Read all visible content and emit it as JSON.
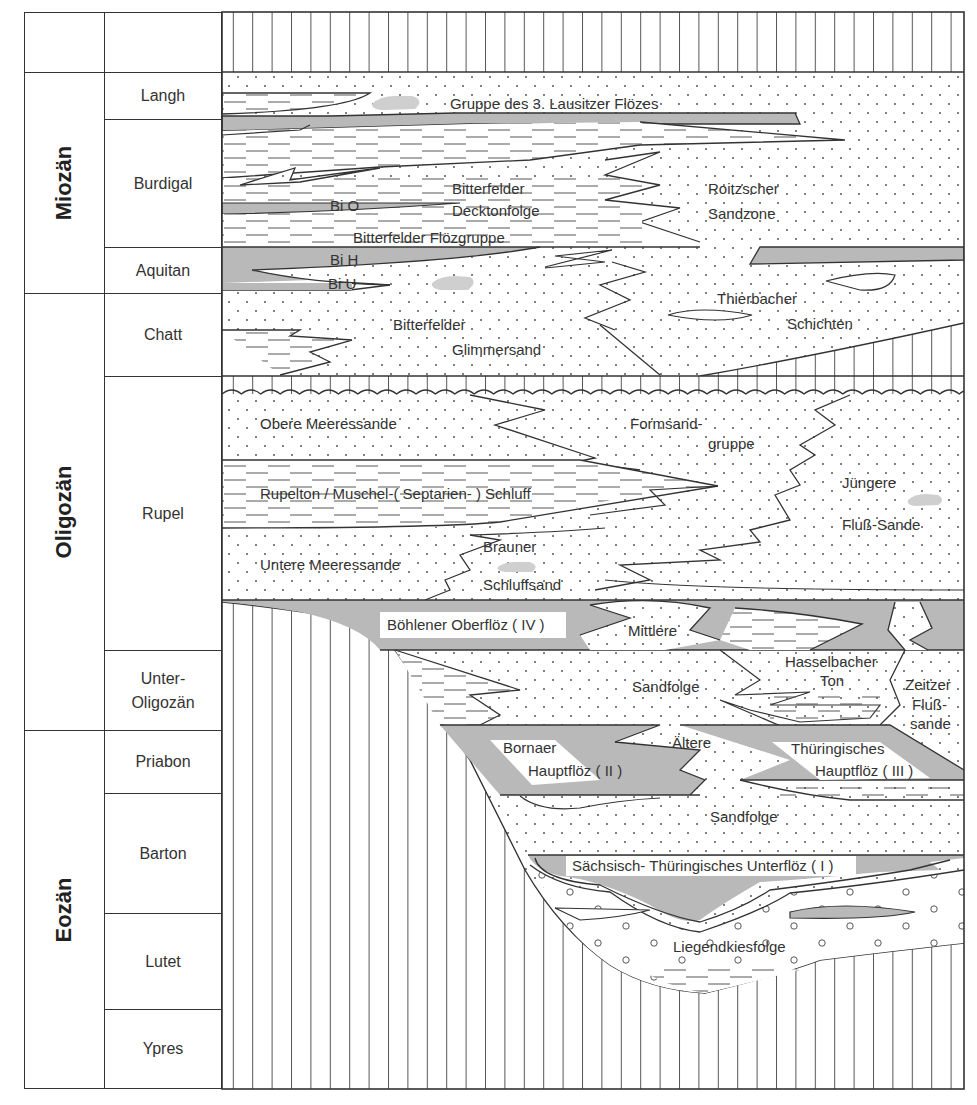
{
  "epochs": [
    {
      "label": "Miozän",
      "top": 72,
      "bottom": 293
    },
    {
      "label": "Oligozän",
      "top": 293,
      "bottom": 730
    },
    {
      "label": "Eozän",
      "top": 730,
      "bottom": 1088
    }
  ],
  "stages": [
    {
      "label": "",
      "top": 12,
      "bottom": 72
    },
    {
      "label": "Langh",
      "top": 72,
      "bottom": 119
    },
    {
      "label": "Burdigal",
      "top": 119,
      "bottom": 247
    },
    {
      "label": "Aquitan",
      "top": 247,
      "bottom": 293
    },
    {
      "label": "Chatt",
      "top": 293,
      "bottom": 376
    },
    {
      "label": "Rupel",
      "top": 376,
      "bottom": 650
    },
    {
      "label": "Unter-\nOligozän",
      "label_line1": "Unter-",
      "label_line2": "Oligozän",
      "top": 650,
      "bottom": 730
    },
    {
      "label": "Priabon",
      "top": 730,
      "bottom": 793
    },
    {
      "label": "Barton",
      "top": 793,
      "bottom": 913
    },
    {
      "label": "Lutet",
      "top": 913,
      "bottom": 1009
    },
    {
      "label": "Ypres",
      "top": 1009,
      "bottom": 1088
    }
  ],
  "units": {
    "lausitz": "Gruppe des 3. Lausitzer Flözes",
    "bitterfelder_deckton_1": "Bitterfelder",
    "bitterfelder_deckton_2": "Decktonfolge",
    "roitzscher_1": "Roitzscher",
    "roitzscher_2": "Sandzone",
    "bi_o": "Bi O",
    "bi_flozgruppe": "Bitterfelder Flözgruppe",
    "bi_h": "Bi H",
    "bi_u": "Bi U",
    "thierbacher_1": "Thierbacher",
    "thierbacher_2": "Schichten",
    "glimmersand_1": "Bitterfelder",
    "glimmersand_2": "Glimmersand",
    "obere_meeressande": "Obere Meeressande",
    "formsand_1": "Formsand-",
    "formsand_2": "gruppe",
    "rupelton": "Rupelton / Muschel-( Septarien- ) Schluff",
    "juengere_1": "Jüngere",
    "juengere_2": "Fluß-Sande",
    "untere_meeressande": "Untere Meeressande",
    "brauner_1": "Brauner",
    "brauner_2": "Schluffsand",
    "boehlener": "Böhlener Oberflöz ( IV )",
    "mittlere": "Mittlere",
    "sandfolge_mid": "Sandfolge",
    "hasselbacher_1": "Hasselbacher",
    "hasselbacher_2": "Ton",
    "zeitzer_1": "Zeitzer",
    "zeitzer_2": "Fluß-",
    "zeitzer_3": "sande",
    "bornaer_1": "Bornaer",
    "bornaer_2": "Hauptflöz ( II )",
    "aeltere": "Ältere",
    "thueringisches_1": "Thüringisches",
    "thueringisches_2": "Hauptflöz ( III )",
    "sandfolge_low": "Sandfolge",
    "unterfloez": "Sächsisch- Thüringisches Unterflöz ( I )",
    "liegendkies": "Liegendkiesfolge"
  },
  "colors": {
    "coal": "#b9b9b9",
    "coal_light": "#d4d4d4",
    "line": "#333333",
    "paper": "#ffffff"
  }
}
